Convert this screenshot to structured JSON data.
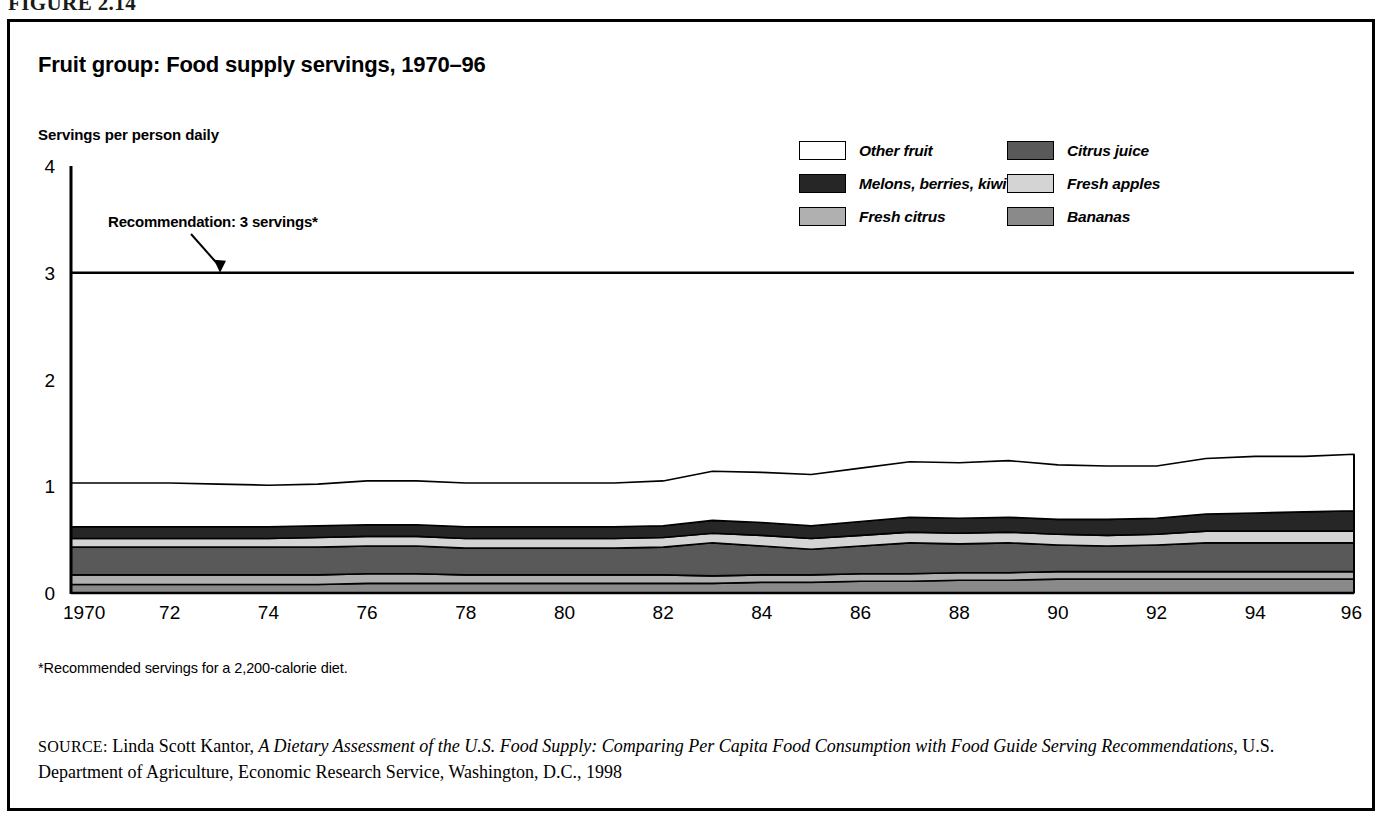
{
  "figure": {
    "number": "FIGURE 2.14"
  },
  "chart": {
    "title": "Fruit group: Food supply servings, 1970–96",
    "axis_caption": "Servings per person daily",
    "annotation": "Recommendation: 3 servings*",
    "footnote": "*Recommended servings for a 2,200-calorie diet."
  },
  "legend": {
    "items": [
      {
        "label": "Other fruit",
        "color": "#ffffff"
      },
      {
        "label": "Citrus juice",
        "color": "#595959"
      },
      {
        "label": "Melons, berries, kiwi",
        "color": "#262626"
      },
      {
        "label": "Fresh apples",
        "color": "#d4d4d4"
      },
      {
        "label": "Fresh citrus",
        "color": "#b0b0b0"
      },
      {
        "label": "Bananas",
        "color": "#8a8a8a"
      }
    ]
  },
  "source": {
    "label": "SOURCE:",
    "author": " Linda Scott Kantor, ",
    "title_italic": "A Dietary Assessment of the U.S. Food Supply: Comparing Per Capita Food Consumption with Food Guide Serving Recommendations,",
    "publisher": " U.S. Department of Agriculture, Economic Research Service, Washington, D.C., 1998"
  },
  "chart_data": {
    "type": "area",
    "title": "Fruit group: Food supply servings, 1970–96",
    "xlabel": "",
    "ylabel": "Servings per person daily",
    "xlim": [
      1970,
      1996
    ],
    "ylim": [
      0,
      4
    ],
    "yticks": [
      0,
      1,
      2,
      3,
      4
    ],
    "ytick_labels": [
      "0",
      "1",
      "2",
      "3",
      "4"
    ],
    "xticks": [
      1970,
      1972,
      1974,
      1976,
      1978,
      1980,
      1982,
      1984,
      1986,
      1988,
      1990,
      1992,
      1994,
      1996
    ],
    "xtick_labels": [
      "1970",
      "72",
      "74",
      "76",
      "78",
      "80",
      "82",
      "84",
      "86",
      "88",
      "90",
      "92",
      "94",
      "96"
    ],
    "grid": false,
    "legend_position": "top-right",
    "stacked": true,
    "stack_order_bottom_to_top": [
      "Bananas",
      "Fresh citrus",
      "Citrus juice",
      "Fresh apples",
      "Melons, berries, kiwi",
      "Other fruit"
    ],
    "reference_line": {
      "value": 3,
      "label": "Recommendation: 3 servings*"
    },
    "x": [
      1970,
      1971,
      1972,
      1973,
      1974,
      1975,
      1976,
      1977,
      1978,
      1979,
      1980,
      1981,
      1982,
      1983,
      1984,
      1985,
      1986,
      1987,
      1988,
      1989,
      1990,
      1991,
      1992,
      1993,
      1994,
      1995,
      1996
    ],
    "series": [
      {
        "name": "Bananas",
        "color": "#8a8a8a",
        "values": [
          0.08,
          0.08,
          0.08,
          0.08,
          0.08,
          0.08,
          0.09,
          0.09,
          0.09,
          0.09,
          0.09,
          0.09,
          0.09,
          0.09,
          0.1,
          0.1,
          0.11,
          0.11,
          0.12,
          0.12,
          0.13,
          0.13,
          0.13,
          0.13,
          0.13,
          0.13,
          0.13
        ]
      },
      {
        "name": "Fresh citrus",
        "color": "#b0b0b0",
        "values": [
          0.09,
          0.09,
          0.09,
          0.09,
          0.09,
          0.09,
          0.09,
          0.09,
          0.08,
          0.08,
          0.08,
          0.08,
          0.08,
          0.07,
          0.07,
          0.07,
          0.07,
          0.07,
          0.07,
          0.07,
          0.07,
          0.07,
          0.07,
          0.07,
          0.07,
          0.07,
          0.07
        ]
      },
      {
        "name": "Citrus juice",
        "color": "#595959",
        "values": [
          0.26,
          0.26,
          0.26,
          0.26,
          0.26,
          0.26,
          0.26,
          0.26,
          0.25,
          0.25,
          0.25,
          0.25,
          0.26,
          0.31,
          0.27,
          0.24,
          0.26,
          0.29,
          0.27,
          0.28,
          0.25,
          0.24,
          0.25,
          0.27,
          0.27,
          0.27,
          0.27
        ]
      },
      {
        "name": "Fresh apples",
        "color": "#d4d4d4",
        "values": [
          0.08,
          0.08,
          0.08,
          0.08,
          0.08,
          0.09,
          0.09,
          0.09,
          0.09,
          0.09,
          0.09,
          0.09,
          0.09,
          0.09,
          0.1,
          0.1,
          0.1,
          0.1,
          0.1,
          0.1,
          0.1,
          0.1,
          0.1,
          0.11,
          0.11,
          0.11,
          0.11
        ]
      },
      {
        "name": "Melons, berries, kiwi",
        "color": "#262626",
        "values": [
          0.11,
          0.11,
          0.11,
          0.11,
          0.11,
          0.11,
          0.11,
          0.11,
          0.11,
          0.11,
          0.11,
          0.11,
          0.11,
          0.12,
          0.12,
          0.12,
          0.13,
          0.14,
          0.14,
          0.14,
          0.14,
          0.15,
          0.15,
          0.16,
          0.17,
          0.18,
          0.19
        ]
      },
      {
        "name": "Other fruit",
        "color": "#ffffff",
        "values": [
          0.41,
          0.41,
          0.41,
          0.4,
          0.39,
          0.39,
          0.41,
          0.41,
          0.41,
          0.41,
          0.41,
          0.41,
          0.42,
          0.46,
          0.47,
          0.48,
          0.5,
          0.52,
          0.52,
          0.53,
          0.51,
          0.5,
          0.49,
          0.52,
          0.53,
          0.52,
          0.53
        ]
      }
    ],
    "totals": [
      1.03,
      1.03,
      1.03,
      1.02,
      1.01,
      1.02,
      1.05,
      1.05,
      1.03,
      1.03,
      1.03,
      1.03,
      1.05,
      1.14,
      1.13,
      1.11,
      1.17,
      1.23,
      1.22,
      1.24,
      1.2,
      1.19,
      1.19,
      1.26,
      1.28,
      1.28,
      1.3
    ]
  }
}
